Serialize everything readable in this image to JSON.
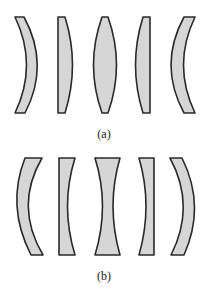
{
  "figure": {
    "colors": {
      "fill": "#d6d6d6",
      "stroke": "#2a2a2a"
    },
    "panels": [
      {
        "label": "(a)",
        "kind": "converging lenses",
        "lenses": [
          "convex meniscus (left)",
          "plano-convex",
          "biconvex",
          "convex-plano",
          "convex meniscus (right)"
        ]
      },
      {
        "label": "(b)",
        "kind": "diverging lenses",
        "lenses": [
          "concave meniscus (left)",
          "plano-concave",
          "biconcave",
          "concave-plano",
          "concave meniscus (right)"
        ]
      }
    ]
  }
}
